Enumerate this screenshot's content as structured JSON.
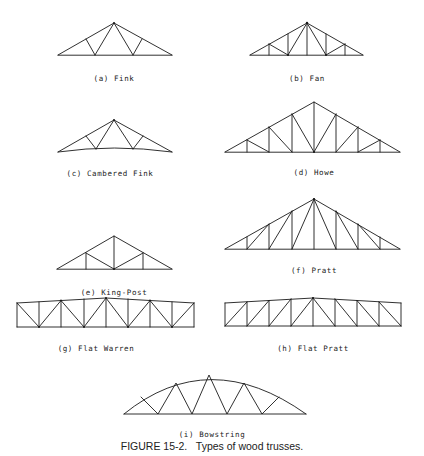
{
  "figure": {
    "caption": "FIGURE 15-2.   Types of wood trusses.",
    "trusses": [
      {
        "id": "a",
        "label": "(a) Fink"
      },
      {
        "id": "b",
        "label": "(b) Fan"
      },
      {
        "id": "c",
        "label": "(c) Cambered Fink"
      },
      {
        "id": "d",
        "label": "(d) Howe"
      },
      {
        "id": "e",
        "label": "(e) King-Post"
      },
      {
        "id": "f",
        "label": "(f) Pratt"
      },
      {
        "id": "g",
        "label": "(g) Flat Warren"
      },
      {
        "id": "h",
        "label": "(h) Flat Pratt"
      },
      {
        "id": "i",
        "label": "(i) Bowstring"
      }
    ]
  },
  "colors": {
    "line": "#1a1a1a",
    "text": "#222222",
    "background": "#ffffff"
  }
}
